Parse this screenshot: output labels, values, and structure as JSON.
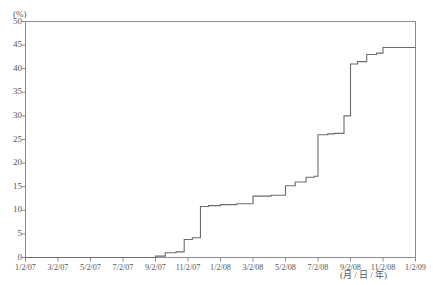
{
  "chart_data": {
    "type": "line",
    "title": "",
    "subtitle": "",
    "xlabel": "(月 / 日 / 年)",
    "ylabel": "(%)",
    "ylim": [
      0,
      50
    ],
    "ytick_values": [
      0,
      5,
      10,
      15,
      20,
      25,
      30,
      35,
      40,
      45,
      50
    ],
    "ytick_labels": [
      "0",
      "5",
      "10",
      "15",
      "20",
      "25",
      "30",
      "35",
      "40",
      "45",
      "50"
    ],
    "xtick_labels": [
      "1/2/07",
      "3/2/07",
      "5/2/07",
      "7/2/07",
      "9/2/07",
      "11/2/07",
      "1/2/08",
      "3/2/08",
      "5/2/08",
      "7/2/08",
      "9/2/08",
      "11/2/08",
      "1/2/09"
    ],
    "grid": false,
    "legend": null,
    "line_color": "#6b6b6b",
    "axis_color": "#8a8a8a",
    "step_style": "post",
    "x": [
      "1/2/07",
      "5/2/07",
      "8/2/07",
      "9/2/07",
      "9/20/07",
      "10/10/07",
      "10/25/07",
      "11/10/07",
      "11/25/07",
      "12/10/07",
      "1/2/08",
      "2/2/08",
      "3/2/08",
      "4/5/08",
      "5/2/08",
      "5/20/08",
      "6/10/08",
      "6/25/08",
      "7/2/08",
      "7/20/08",
      "8/2/08",
      "8/20/08",
      "9/2/08",
      "9/15/08",
      "10/2/08",
      "10/20/08",
      "11/2/08",
      "12/2/08",
      "1/2/09"
    ],
    "values": [
      0,
      0,
      0,
      0.3,
      1.0,
      1.2,
      3.8,
      4.2,
      10.8,
      11.0,
      11.2,
      11.4,
      13.0,
      13.2,
      15.2,
      16.0,
      17.0,
      17.2,
      26.0,
      26.2,
      26.3,
      30.0,
      41.0,
      41.5,
      43.0,
      43.3,
      44.5,
      44.5,
      44.5
    ],
    "series": [
      {
        "name": "cumulative-percentage",
        "values": [
          0,
          0,
          0,
          0.3,
          1.0,
          1.2,
          3.8,
          4.2,
          10.8,
          11.0,
          11.2,
          11.4,
          13.0,
          13.2,
          15.2,
          16.0,
          17.0,
          17.2,
          26.0,
          26.2,
          26.3,
          30.0,
          41.0,
          41.5,
          43.0,
          43.3,
          44.5,
          44.5,
          44.5
        ]
      }
    ],
    "notable_points": {
      "start_value": 0,
      "first_rise_date": "9/2/07",
      "plateau_before_jump": 26.0,
      "jump_end_value": 41.0,
      "final_value": 44.5
    }
  }
}
